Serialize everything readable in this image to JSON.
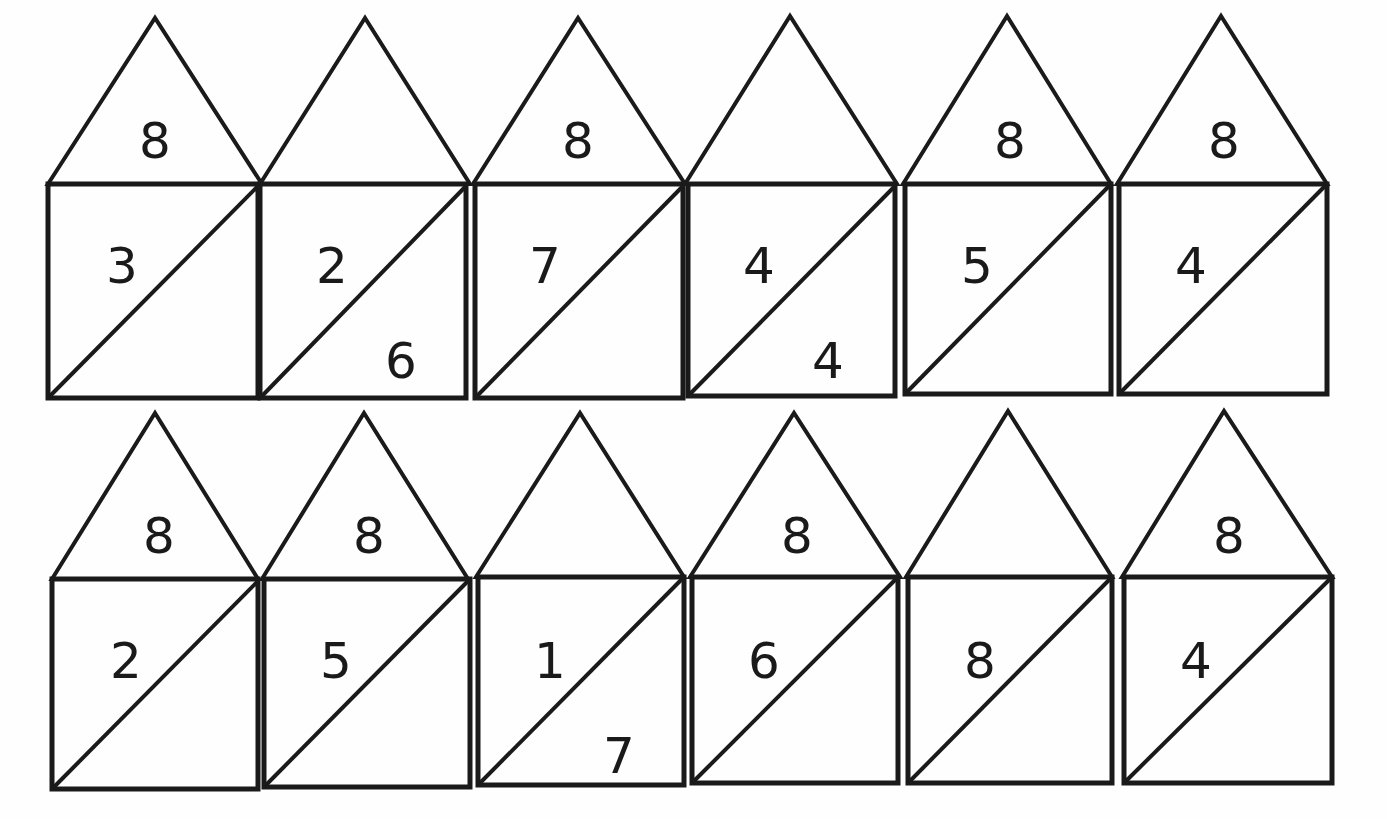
{
  "worksheet": {
    "title": "Number houses (number bonds) for 8",
    "colors": {
      "line": "#1a1a1a",
      "background": "#ffffff"
    },
    "rows": [
      {
        "houses": [
          {
            "roof": "8",
            "left": "3",
            "right": ""
          },
          {
            "roof": "",
            "left": "2",
            "right": "6"
          },
          {
            "roof": "8",
            "left": "7",
            "right": ""
          },
          {
            "roof": "",
            "left": "4",
            "right": "4"
          },
          {
            "roof": "8",
            "left": "5",
            "right": ""
          },
          {
            "roof": "8",
            "left": "4",
            "right": ""
          }
        ]
      },
      {
        "houses": [
          {
            "roof": "8",
            "left": "2",
            "right": ""
          },
          {
            "roof": "8",
            "left": "5",
            "right": ""
          },
          {
            "roof": "",
            "left": "1",
            "right": "7"
          },
          {
            "roof": "8",
            "left": "6",
            "right": ""
          },
          {
            "roof": "",
            "left": "8",
            "right": ""
          },
          {
            "roof": "8",
            "left": "4",
            "right": ""
          }
        ]
      }
    ]
  }
}
